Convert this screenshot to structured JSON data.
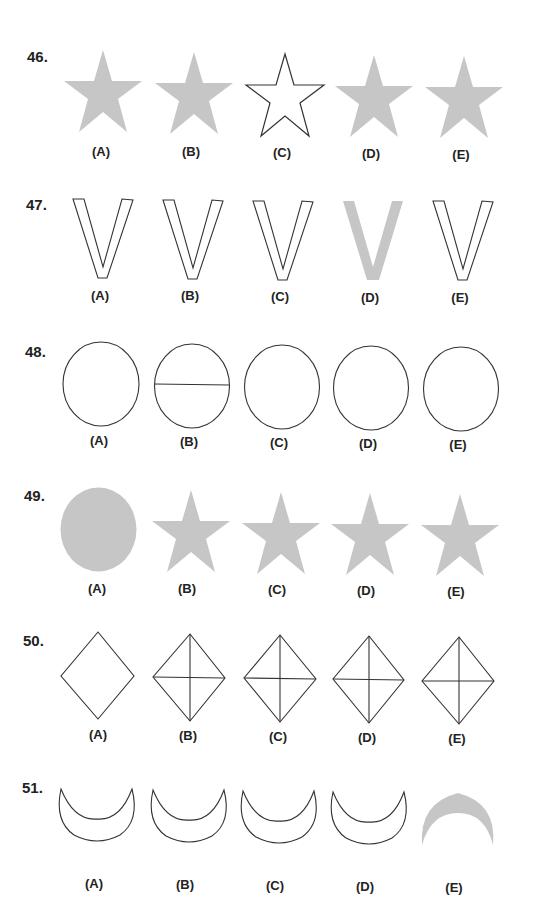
{
  "colors": {
    "shade": "#c6c6c6",
    "stroke": "#333333"
  },
  "questions": [
    {
      "number": "46.",
      "options": [
        {
          "label": "(A)",
          "shape": "star-shaded"
        },
        {
          "label": "(B)",
          "shape": "star-shaded"
        },
        {
          "label": "(C)",
          "shape": "star-outline"
        },
        {
          "label": "(D)",
          "shape": "star-shaded"
        },
        {
          "label": "(E)",
          "shape": "star-shaded"
        }
      ]
    },
    {
      "number": "47.",
      "options": [
        {
          "label": "(A)",
          "shape": "v-outline"
        },
        {
          "label": "(B)",
          "shape": "v-outline"
        },
        {
          "label": "(C)",
          "shape": "v-outline"
        },
        {
          "label": "(D)",
          "shape": "v-shaded"
        },
        {
          "label": "(E)",
          "shape": "v-outline"
        }
      ]
    },
    {
      "number": "48.",
      "options": [
        {
          "label": "(A)",
          "shape": "circle-outline"
        },
        {
          "label": "(B)",
          "shape": "circle-with-diameter"
        },
        {
          "label": "(C)",
          "shape": "circle-outline"
        },
        {
          "label": "(D)",
          "shape": "circle-outline"
        },
        {
          "label": "(E)",
          "shape": "circle-outline"
        }
      ]
    },
    {
      "number": "49.",
      "options": [
        {
          "label": "(A)",
          "shape": "circle-shaded"
        },
        {
          "label": "(B)",
          "shape": "star-shaded"
        },
        {
          "label": "(C)",
          "shape": "star-shaded"
        },
        {
          "label": "(D)",
          "shape": "star-shaded"
        },
        {
          "label": "(E)",
          "shape": "star-shaded"
        }
      ]
    },
    {
      "number": "50.",
      "options": [
        {
          "label": "(A)",
          "shape": "diamond-outline"
        },
        {
          "label": "(B)",
          "shape": "diamond-with-cross"
        },
        {
          "label": "(C)",
          "shape": "diamond-with-cross"
        },
        {
          "label": "(D)",
          "shape": "diamond-with-cross"
        },
        {
          "label": "(E)",
          "shape": "diamond-with-cross"
        }
      ]
    },
    {
      "number": "51.",
      "options": [
        {
          "label": "(A)",
          "shape": "crescent-outline-up"
        },
        {
          "label": "(B)",
          "shape": "crescent-outline-up"
        },
        {
          "label": "(C)",
          "shape": "crescent-outline-up"
        },
        {
          "label": "(D)",
          "shape": "crescent-outline-up"
        },
        {
          "label": "(E)",
          "shape": "crescent-shaded-down"
        }
      ]
    }
  ]
}
